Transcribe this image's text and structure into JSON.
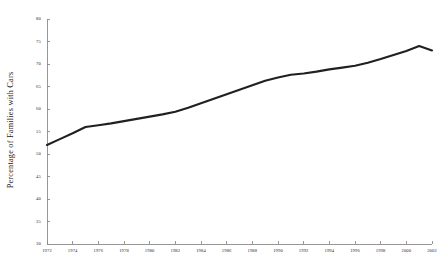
{
  "chart_data": {
    "type": "line",
    "title": "",
    "xlabel": "",
    "ylabel": "Percentage of Families with Cars",
    "xlim": [
      1972,
      2002
    ],
    "ylim": [
      30,
      80
    ],
    "grid": false,
    "legend": null,
    "y_ticks": [
      80,
      75,
      70,
      65,
      60,
      55,
      50,
      45,
      40,
      35,
      30
    ],
    "x_ticks": [
      1972,
      1974,
      1976,
      1978,
      1980,
      1982,
      1984,
      1986,
      1988,
      1990,
      1992,
      1994,
      1996,
      1998,
      2000,
      2002
    ],
    "series": [
      {
        "name": "Percentage of Families with Cars",
        "color": "#231f20",
        "x": [
          1972,
          1973,
          1974,
          1975,
          1976,
          1977,
          1978,
          1979,
          1980,
          1981,
          1982,
          1983,
          1984,
          1985,
          1986,
          1987,
          1988,
          1989,
          1990,
          1991,
          1992,
          1993,
          1994,
          1995,
          1996,
          1997,
          1998,
          1999,
          2000,
          2001,
          2002
        ],
        "values": [
          52.0,
          53.3,
          54.6,
          56.0,
          56.4,
          56.8,
          57.3,
          57.8,
          58.3,
          58.8,
          59.4,
          60.3,
          61.3,
          62.3,
          63.3,
          64.3,
          65.3,
          66.3,
          67.0,
          67.6,
          67.9,
          68.3,
          68.8,
          69.2,
          69.6,
          70.3,
          71.1,
          72.0,
          72.9,
          74.0,
          73.0
        ]
      }
    ]
  },
  "axes": {
    "y_tick_labels": [
      "80",
      "75",
      "70",
      "65",
      "60",
      "55",
      "50",
      "45",
      "40",
      "35",
      "30"
    ],
    "x_tick_labels": [
      "1972",
      "1974",
      "1976",
      "1978",
      "1980",
      "1982",
      "1984",
      "1986",
      "1988",
      "1990",
      "1992",
      "1994",
      "1996",
      "1998",
      "2000",
      "2002"
    ],
    "y_axis_title": "Percentage of Families with Cars"
  },
  "colors": {
    "line": "#231f20",
    "axis": "#8c8c8c",
    "text": "#2b2b2b",
    "background": "#ffffff"
  }
}
